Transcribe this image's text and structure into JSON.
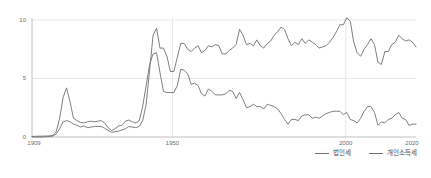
{
  "chart_data": {
    "type": "line",
    "title": "",
    "xlabel": "",
    "ylabel": "",
    "xlim": [
      1909,
      2020
    ],
    "ylim": [
      0,
      10
    ],
    "grid": true,
    "legend_position": "bottom-right",
    "x_ticks": [
      "1909",
      "1950",
      "2000",
      "2020"
    ],
    "x_tick_values": [
      1909,
      1950,
      2000,
      2020
    ],
    "y_ticks": [
      "0",
      "5",
      "10"
    ],
    "y_tick_values": [
      0,
      5,
      10
    ],
    "colors": {
      "corporate": "#6f6f6f",
      "income": "#6f6f6f",
      "grid": "#e4e4e4",
      "axis": "#b9b9b9",
      "tick_text": "#6b6b6b"
    },
    "x": [
      1909,
      1910,
      1911,
      1912,
      1913,
      1914,
      1915,
      1916,
      1917,
      1918,
      1919,
      1920,
      1921,
      1922,
      1923,
      1924,
      1925,
      1926,
      1927,
      1928,
      1929,
      1930,
      1931,
      1932,
      1933,
      1934,
      1935,
      1936,
      1937,
      1938,
      1939,
      1940,
      1941,
      1942,
      1943,
      1944,
      1945,
      1946,
      1947,
      1948,
      1949,
      1950,
      1951,
      1952,
      1953,
      1954,
      1955,
      1956,
      1957,
      1958,
      1959,
      1960,
      1961,
      1962,
      1963,
      1964,
      1965,
      1966,
      1967,
      1968,
      1969,
      1970,
      1971,
      1972,
      1973,
      1974,
      1975,
      1976,
      1977,
      1978,
      1979,
      1980,
      1981,
      1982,
      1983,
      1984,
      1985,
      1986,
      1987,
      1988,
      1989,
      1990,
      1991,
      1992,
      1993,
      1994,
      1995,
      1996,
      1997,
      1998,
      1999,
      2000,
      2001,
      2002,
      2003,
      2004,
      2005,
      2006,
      2007,
      2008,
      2009,
      2010,
      2011,
      2012,
      2013,
      2014,
      2015,
      2016,
      2017,
      2018,
      2019,
      2020
    ],
    "series": [
      {
        "name": "법인세",
        "label": "법인세",
        "color": "#6f6f6f",
        "values": [
          0.05,
          0.06,
          0.07,
          0.07,
          0.08,
          0.1,
          0.12,
          0.45,
          1.6,
          3.4,
          4.2,
          3.0,
          1.6,
          1.4,
          1.25,
          1.2,
          1.3,
          1.35,
          1.3,
          1.35,
          1.4,
          1.2,
          0.8,
          0.55,
          0.7,
          0.95,
          1.0,
          1.35,
          1.45,
          1.3,
          1.2,
          1.4,
          2.6,
          4.4,
          6.2,
          7.1,
          7.2,
          5.5,
          3.9,
          3.8,
          3.8,
          3.8,
          4.4,
          5.8,
          5.7,
          5.4,
          4.5,
          4.6,
          4.4,
          3.7,
          3.5,
          4.1,
          3.9,
          3.6,
          3.6,
          3.6,
          3.7,
          4.0,
          3.9,
          3.3,
          3.8,
          3.2,
          2.5,
          2.6,
          2.8,
          2.6,
          2.6,
          2.4,
          2.8,
          2.7,
          2.6,
          2.4,
          2.0,
          1.5,
          1.1,
          1.5,
          1.5,
          1.4,
          1.8,
          1.9,
          1.9,
          1.6,
          1.7,
          1.6,
          1.8,
          2.0,
          2.1,
          2.2,
          2.2,
          2.2,
          1.9,
          2.1,
          1.5,
          1.4,
          1.2,
          1.6,
          2.2,
          2.6,
          2.6,
          2.1,
          1.0,
          1.3,
          1.2,
          1.5,
          1.6,
          1.9,
          2.1,
          1.6,
          1.5,
          1.0,
          1.1,
          1.1
        ]
      },
      {
        "name": "개인소득세",
        "label": "개인소득세",
        "color": "#6f6f6f",
        "values": [
          0.0,
          0.0,
          0.0,
          0.0,
          0.02,
          0.05,
          0.08,
          0.25,
          0.7,
          1.3,
          1.4,
          1.3,
          1.1,
          1.0,
          0.85,
          0.95,
          0.8,
          0.85,
          0.9,
          0.9,
          0.9,
          0.75,
          0.55,
          0.4,
          0.45,
          0.5,
          0.6,
          0.7,
          0.9,
          0.85,
          0.8,
          0.9,
          1.4,
          2.8,
          5.7,
          8.7,
          9.3,
          7.6,
          7.6,
          6.9,
          5.6,
          5.6,
          6.8,
          8.0,
          8.0,
          7.5,
          7.3,
          7.6,
          7.8,
          7.2,
          7.4,
          7.8,
          7.7,
          7.9,
          7.8,
          7.1,
          7.1,
          7.4,
          7.6,
          7.9,
          9.2,
          8.7,
          7.9,
          8.0,
          7.8,
          8.3,
          7.8,
          7.6,
          8.0,
          8.2,
          8.7,
          9.0,
          9.4,
          9.2,
          8.4,
          7.8,
          8.1,
          7.9,
          8.4,
          8.0,
          8.3,
          8.1,
          7.9,
          7.6,
          7.7,
          7.8,
          8.1,
          8.5,
          9.0,
          9.6,
          9.6,
          10.2,
          9.9,
          8.1,
          7.2,
          6.9,
          7.5,
          7.9,
          8.4,
          7.9,
          6.4,
          6.2,
          7.3,
          7.3,
          7.9,
          8.1,
          8.7,
          8.4,
          8.2,
          8.3,
          8.1,
          7.7
        ]
      }
    ]
  },
  "legend": {
    "items": [
      {
        "label": "법인세"
      },
      {
        "label": "개인소득세"
      }
    ]
  },
  "axes": {
    "y_tick_0": "0",
    "y_tick_1": "5",
    "y_tick_2": "10",
    "x_tick_0": "1909",
    "x_tick_1": "1950",
    "x_tick_2": "2000",
    "x_tick_3": "2020"
  }
}
